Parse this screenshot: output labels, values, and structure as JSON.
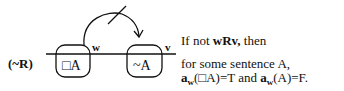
{
  "diagram": {
    "rule_label": "(~R)",
    "world_left": {
      "label": "w",
      "content": "□A"
    },
    "world_right": {
      "label": "v",
      "content": "~A"
    },
    "arrow": {
      "from": "w",
      "to": "v",
      "crossed_out": true
    }
  },
  "explanation": {
    "line1_prefix": "If not ",
    "line1_bold": "wRv,",
    "line1_suffix": " then",
    "line2": "for some sentence A,",
    "line3_a1": "a",
    "line3_sub1": "w",
    "line3_mid1": "(□A)=T and ",
    "line3_a2": "a",
    "line3_sub2": "w",
    "line3_end": "(A)=F."
  }
}
